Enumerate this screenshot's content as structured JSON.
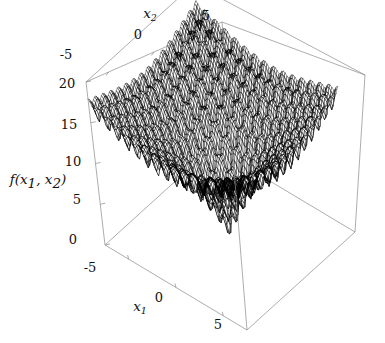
{
  "figure": {
    "kind": "3d-surface-wireframe",
    "background_color": "#ffffff",
    "mesh_color": "#000000",
    "axis_color": "#8a8a8a",
    "text_color": "#111111"
  },
  "labels": {
    "x1_axis_label": "x",
    "x1_axis_sub": "1",
    "x2_axis_label": "x",
    "x2_axis_sub": "2",
    "z_axis_label_f": "f",
    "z_axis_label_open": "(",
    "z_axis_label_x_a": "x",
    "z_axis_label_sub_a": "1",
    "z_axis_label_comma": ", ",
    "z_axis_label_x_b": "x",
    "z_axis_label_sub_b": "2",
    "z_axis_label_close": ")"
  },
  "ticks": {
    "x1": [
      "-5",
      "0",
      "5"
    ],
    "x2": [
      "-5",
      "0",
      "5"
    ],
    "z": [
      "0",
      "5",
      "10",
      "15",
      "20"
    ]
  },
  "chart_data": {
    "type": "surface",
    "title": "",
    "xlabel": "x_1",
    "ylabel": "x_2",
    "zlabel": "f(x_1, x_2)",
    "function": "Ackley",
    "formula": "f(x1,x2) = -20*exp(-0.2*sqrt(0.5*(x1^2+x2^2))) - exp(0.5*(cos(2*pi*x1)+cos(2*pi*x2))) + 20 + e",
    "xlim": [
      -7.5,
      7.5
    ],
    "ylim": [
      -7.5,
      7.5
    ],
    "zlim": [
      0,
      20
    ],
    "xticks": [
      -5,
      0,
      5
    ],
    "yticks": [
      -5,
      0,
      5
    ],
    "zticks": [
      0,
      5,
      10,
      15,
      20
    ],
    "grid": false,
    "legend": false,
    "global_minimum": {
      "x1": 0,
      "x2": 0,
      "value": 0
    },
    "max_value_at_corners": 20,
    "samples_per_axis": 85
  },
  "view": {
    "box_corners_px": {
      "top_left": [
        86,
        82
      ],
      "top_apex": [
        222,
        22
      ],
      "top_right": [
        365,
        75
      ],
      "bottom_left": [
        105,
        245
      ],
      "bottom_front": [
        247,
        330
      ],
      "bottom_right": [
        355,
        232
      ]
    },
    "z_tick_y_px": {
      "20": 84,
      "15": 125,
      "10": 162,
      "5": 200,
      "0": 240
    }
  }
}
